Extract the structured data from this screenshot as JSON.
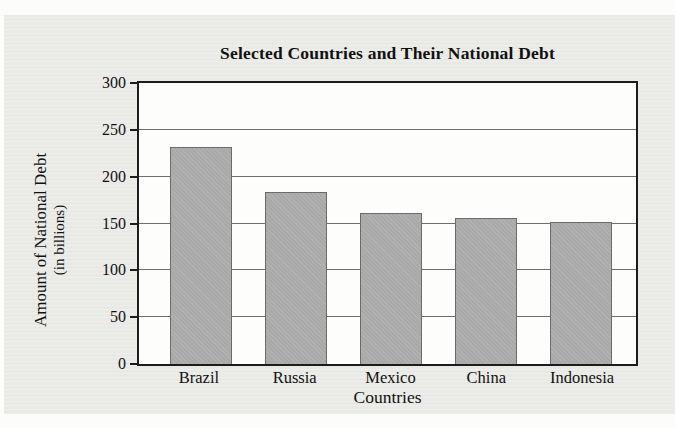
{
  "title": "Selected Countries and Their National Debt",
  "y_axis": {
    "label_line1": "Amount of National Debt",
    "label_line2": "(in billions)",
    "ticks": [
      0,
      50,
      100,
      150,
      200,
      250,
      300
    ]
  },
  "x_axis": {
    "label": "Countries"
  },
  "chart_data": {
    "type": "bar",
    "title": "Selected Countries and Their National Debt",
    "categories": [
      "Brazil",
      "Russia",
      "Mexico",
      "China",
      "Indonesia"
    ],
    "values": [
      232,
      184,
      161,
      156,
      152
    ],
    "xlabel": "Countries",
    "ylabel": "Amount of National Debt (in billions)",
    "ylim": [
      0,
      300
    ],
    "ytick_interval": 50,
    "grid": true,
    "legend": false,
    "bar_orientation": "vertical"
  },
  "colors": {
    "panel_bg": "#e9e9e6",
    "plot_bg": "#fdfdfb",
    "bar_fill": "#a9a9a9",
    "bar_border": "#6b6b6b",
    "gridline": "#6f6f6f",
    "frame": "#1c1c1c",
    "text": "#111111"
  }
}
